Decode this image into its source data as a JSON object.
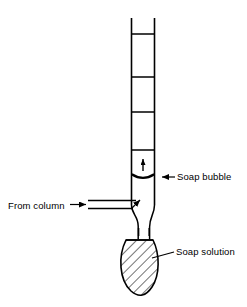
{
  "figure": {
    "name": "soap-bubble-flowmeter",
    "background_color": "#ffffff",
    "line_color": "#000000"
  },
  "labels": {
    "from_column": "From column",
    "soap_bubble": "Soap bubble",
    "soap_solution": "Soap solution"
  },
  "annotations": {
    "bubble_direction_arrow": "up-arrow",
    "inlet_arrow": "right-arrow",
    "bubble_leader_arrow": "left-arrow"
  },
  "components": {
    "graduated_tube": {
      "name": "graduated-burette-tube",
      "left_x": 131,
      "right_x": 155,
      "top_y": 18,
      "bottom_y": 205,
      "graduation_y": [
        34,
        77,
        112,
        150
      ]
    },
    "side_inlet_tube": {
      "name": "side-inlet-tube",
      "left_x": 88,
      "right_x": 137,
      "top_y": 200,
      "bottom_y": 208
    },
    "taper_neck": {
      "name": "tapered-neck",
      "top_y": 205,
      "bottom_y": 238,
      "neck_left_x": 138,
      "neck_right_x": 150
    },
    "bulb": {
      "name": "soap-solution-bulb",
      "center_x": 140,
      "top_y": 238,
      "bottom_y": 296,
      "half_width": 18,
      "fill": "hatched"
    },
    "soap_bubble_film": {
      "name": "soap-bubble-meniscus",
      "y": 176,
      "left_x": 132,
      "right_x": 154
    }
  }
}
